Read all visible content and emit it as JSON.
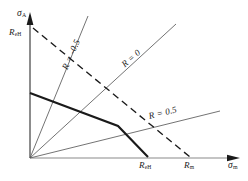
{
  "figure": {
    "type": "haigh-fatigue-diagram",
    "background_color": "#ffffff",
    "ink_color": "#1a1a1a",
    "axes": {
      "y_axis": {
        "name": "stress-amplitude-axis",
        "label_main": "σ",
        "label_sub": "A",
        "arrow": "up",
        "origin_px": [
          30,
          158
        ],
        "tip_px": [
          30,
          14
        ]
      },
      "x_axis": {
        "name": "mean-stress-axis",
        "label_main": "σ",
        "label_sub": "m",
        "arrow": "right",
        "origin_px": [
          30,
          158
        ],
        "tip_px": [
          240,
          158
        ]
      }
    },
    "axis_markers": [
      {
        "id": "ReH-y",
        "label_main": "R",
        "label_sub": "eH",
        "axis": "y",
        "px": [
          30,
          33
        ]
      },
      {
        "id": "ReH-x",
        "label_main": "R",
        "label_sub": "eH",
        "axis": "x",
        "px": [
          148,
          158
        ]
      },
      {
        "id": "Rm-x",
        "label_main": "R",
        "label_sub": "m",
        "axis": "x",
        "px": [
          190,
          158
        ]
      }
    ],
    "ray_lines": [
      {
        "id": "ray-R-minus-0p5",
        "label": "R = -0.5",
        "style": "thin-solid",
        "rotation_deg": -66,
        "from_px": [
          30,
          158
        ],
        "to_px": [
          88,
          16
        ],
        "label_px": [
          74,
          58
        ]
      },
      {
        "id": "ray-R-0",
        "label": "R = 0",
        "style": "thin-solid",
        "rotation_deg": -41,
        "from_px": [
          30,
          158
        ],
        "to_px": [
          176,
          24
        ],
        "label_px": [
          131,
          58
        ]
      },
      {
        "id": "ray-R-0p5",
        "label": "R = 0.5",
        "style": "thin-solid",
        "rotation_deg": -14,
        "from_px": [
          30,
          158
        ],
        "to_px": [
          220,
          111
        ],
        "label_px": [
          154,
          110
        ]
      }
    ],
    "curves": [
      {
        "id": "endurance-limit-line",
        "style": "thick-solid",
        "description": "fatigue strength boundary",
        "points_px": [
          [
            30,
            93
          ],
          [
            118,
            126
          ],
          [
            148,
            157
          ]
        ]
      },
      {
        "id": "yield-reference-line",
        "style": "dashed",
        "description": "mean stress line to tensile strength",
        "points_px": [
          [
            33,
            28
          ],
          [
            190,
            157
          ]
        ]
      }
    ]
  }
}
